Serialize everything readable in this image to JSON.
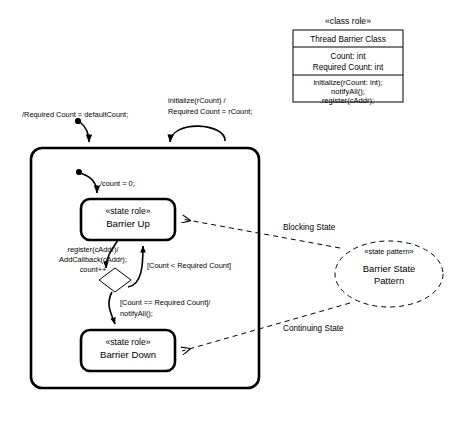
{
  "diagram": {
    "colors": {
      "stroke": "#000000",
      "background": "#ffffff"
    },
    "class_role": {
      "stereotype": "«class role»",
      "name": "Thread Barrier Class",
      "attributes": [
        "Count: int",
        "Required Count: int"
      ],
      "operations": [
        "initialize(rCount: int);",
        "notifyAll();",
        "register(cAddr);"
      ]
    },
    "incoming_transitions": [
      {
        "id": "default-count",
        "label": "/Required Count = defaultCount;"
      },
      {
        "id": "initialize",
        "line1": "initialize(rCount) /",
        "line2": "Required Count = rCount;"
      }
    ],
    "initial_transition": {
      "label": "/count = 0;"
    },
    "states": [
      {
        "id": "barrier-up",
        "stereotype": "«state role»",
        "name": "Barrier Up"
      },
      {
        "id": "barrier-down",
        "stereotype": "«state role»",
        "name": "Barrier Down"
      }
    ],
    "transitions": [
      {
        "id": "register",
        "line1": "register(cAddr)/",
        "line2": "AddCallback(cAddr);",
        "line3": "count++"
      },
      {
        "id": "guard-less",
        "label": "[Count < Required Count]"
      },
      {
        "id": "guard-equal",
        "line1": "[Count == Required Count]/",
        "line2": "notifyAll();"
      }
    ],
    "pattern": {
      "stereotype": "«state pattern»",
      "line1": "Barrier State",
      "line2": "Pattern"
    },
    "role_links": [
      {
        "id": "blocking-state",
        "label": "Blocking State"
      },
      {
        "id": "continuing-state",
        "label": "Continuing State"
      }
    ]
  }
}
